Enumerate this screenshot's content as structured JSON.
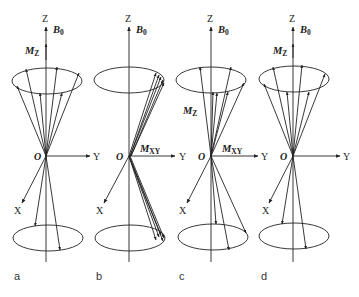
{
  "figure": {
    "colors": {
      "stroke": "#222222",
      "background": "#ffffff"
    },
    "axis_labels": {
      "z": "Z",
      "y": "Y",
      "x": "X",
      "origin": "O"
    },
    "field_label": {
      "main": "B",
      "sub": "0"
    },
    "mz_label": {
      "main": "M",
      "sub": "Z"
    },
    "mxy_label": {
      "main": "M",
      "sub": "XY"
    },
    "panels": [
      {
        "id": "a",
        "label": "a",
        "shows_mz": true,
        "shows_mxy": false,
        "phase": "random"
      },
      {
        "id": "b",
        "label": "b",
        "shows_mz": false,
        "shows_mxy": true,
        "phase": "coherent"
      },
      {
        "id": "c",
        "label": "c",
        "shows_mz": true,
        "shows_mxy": true,
        "phase": "partial"
      },
      {
        "id": "d",
        "label": "d",
        "shows_mz": true,
        "shows_mxy": false,
        "phase": "random"
      }
    ]
  }
}
